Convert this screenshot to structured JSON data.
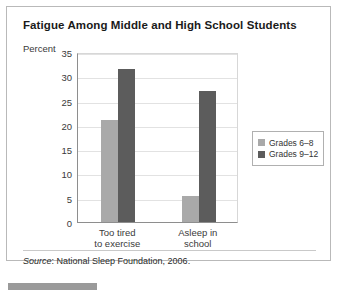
{
  "figure": {
    "title": "Fatigue Among Middle and High School Students",
    "axis_label": "Percent",
    "source_prefix": "Source",
    "source_text": ": National Sleep Foundation, 2006."
  },
  "legend": {
    "items": [
      {
        "label": "Grades 6–8",
        "color": "#a9a9a9"
      },
      {
        "label": "Grades 9–12",
        "color": "#5c5c5c"
      }
    ]
  },
  "chart_data": {
    "type": "bar",
    "title": "Fatigue Among Middle and High School Students",
    "xlabel": "",
    "ylabel": "Percent",
    "ylim": [
      0,
      35
    ],
    "yticks": [
      0,
      5,
      10,
      15,
      20,
      25,
      30,
      35
    ],
    "ytick_labels": [
      "0",
      "5",
      "10",
      "15",
      "20",
      "25",
      "30",
      "35"
    ],
    "grid": true,
    "legend_position": "right",
    "categories": [
      "Too tired to exercise",
      "Asleep in school"
    ],
    "category_lines": [
      [
        "Too tired",
        "to exercise"
      ],
      [
        "Asleep in",
        "school"
      ]
    ],
    "series": [
      {
        "name": "Grades 6–8",
        "color": "#a9a9a9",
        "values": [
          21,
          5.3
        ]
      },
      {
        "name": "Grades 9–12",
        "color": "#5c5c5c",
        "values": [
          31.5,
          27
        ]
      }
    ]
  }
}
